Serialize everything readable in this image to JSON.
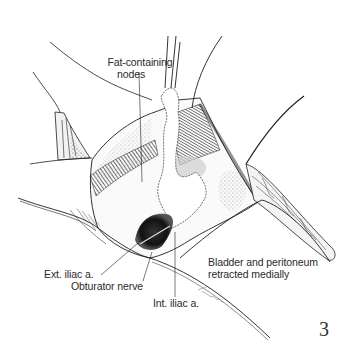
{
  "figure": {
    "number": "3",
    "signature": "Lsein",
    "colors": {
      "background": "#ffffff",
      "ink": "#1e1e1e",
      "text": "#2a2a2a",
      "shade": "#9a9a9a"
    }
  },
  "labels": {
    "fat_nodes_line1": "Fat-containing",
    "fat_nodes_line2": "nodes",
    "ext_iliac": "Ext. iliac a.",
    "obturator": "Obturator nerve",
    "int_iliac": "Int. iliac a.",
    "bladder_line1": "Bladder and peritoneum",
    "bladder_line2": "retracted medially"
  }
}
